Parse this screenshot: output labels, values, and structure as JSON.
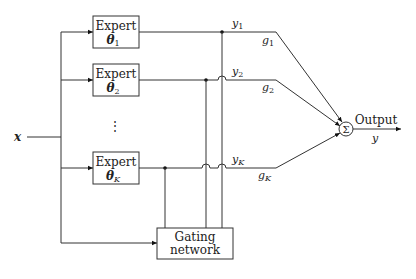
{
  "diagram": {
    "input": {
      "label": "x"
    },
    "experts": [
      {
        "title": "Expert",
        "param": "θ",
        "sub": "1",
        "output": "y",
        "output_sub": "1",
        "gate": "g",
        "gate_sub": "1"
      },
      {
        "title": "Expert",
        "param": "θ",
        "sub": "2",
        "output": "y",
        "output_sub": "2",
        "gate": "g",
        "gate_sub": "2"
      },
      {
        "title": "Expert",
        "param": "θ",
        "sub": "K",
        "output": "y",
        "output_sub": "K",
        "gate": "g",
        "gate_sub": "K"
      }
    ],
    "ellipsis": "⋮",
    "gating": {
      "line1": "Gating",
      "line2": "network"
    },
    "sum": {
      "symbol": "Σ"
    },
    "output": {
      "label": "Output",
      "var": "y"
    }
  }
}
